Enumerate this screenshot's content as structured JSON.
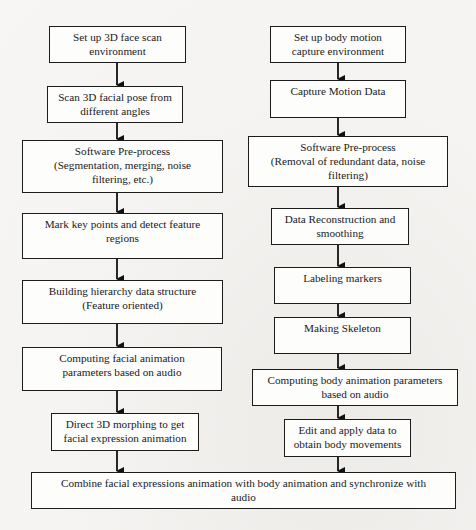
{
  "diagram": {
    "type": "flowchart",
    "left_column": {
      "title": "Facial animation pipeline",
      "steps": [
        {
          "id": "L1",
          "lines": [
            "Set up 3D face scan",
            "environment"
          ]
        },
        {
          "id": "L2",
          "lines": [
            "Scan 3D facial pose from",
            "different angles"
          ]
        },
        {
          "id": "L3",
          "lines": [
            "Software Pre-process",
            "(Segmentation, merging, noise",
            "filtering, etc.)"
          ]
        },
        {
          "id": "L4",
          "lines": [
            "Mark key points and detect feature",
            "regions"
          ]
        },
        {
          "id": "L5",
          "lines": [
            "Building hierarchy data structure",
            "(Feature oriented)"
          ]
        },
        {
          "id": "L6",
          "lines": [
            "Computing facial animation",
            "parameters based on audio"
          ]
        },
        {
          "id": "L7",
          "lines": [
            "Direct 3D morphing to get",
            "facial expression animation"
          ]
        }
      ]
    },
    "right_column": {
      "title": "Body motion pipeline",
      "steps": [
        {
          "id": "R1",
          "lines": [
            "Set up body motion",
            "capture environment"
          ]
        },
        {
          "id": "R2",
          "lines": [
            "Capture Motion Data"
          ]
        },
        {
          "id": "R3",
          "lines": [
            "Software Pre-process",
            "(Removal of redundant data, noise",
            "filtering)"
          ]
        },
        {
          "id": "R4",
          "lines": [
            "Data Reconstruction and",
            "smoothing"
          ]
        },
        {
          "id": "R5",
          "lines": [
            "Labeling markers"
          ]
        },
        {
          "id": "R6",
          "lines": [
            "Making Skeleton"
          ]
        },
        {
          "id": "R7",
          "lines": [
            "Computing body animation parameters",
            "based on audio"
          ]
        },
        {
          "id": "R8",
          "lines": [
            "Edit and apply data to",
            "obtain body movements"
          ]
        }
      ]
    },
    "final_step": {
      "id": "F",
      "lines": [
        "Combine facial expressions animation with body animation and synchronize with",
        "audio"
      ]
    },
    "edges": [
      [
        "L1",
        "L2"
      ],
      [
        "L2",
        "L3"
      ],
      [
        "L3",
        "L4"
      ],
      [
        "L4",
        "L5"
      ],
      [
        "L5",
        "L6"
      ],
      [
        "L6",
        "L7"
      ],
      [
        "L7",
        "F"
      ],
      [
        "R1",
        "R2"
      ],
      [
        "R2",
        "R3"
      ],
      [
        "R3",
        "R4"
      ],
      [
        "R4",
        "R5"
      ],
      [
        "R5",
        "R6"
      ],
      [
        "R6",
        "R7"
      ],
      [
        "R7",
        "R8"
      ],
      [
        "R8",
        "F"
      ]
    ]
  }
}
